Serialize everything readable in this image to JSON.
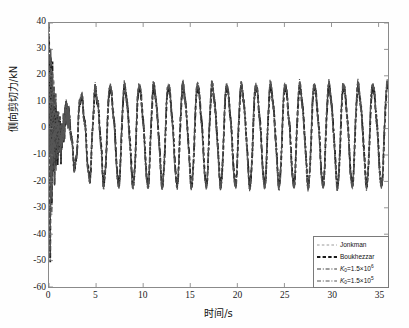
{
  "chart_data": {
    "type": "line",
    "title": "",
    "xlabel": "时间/s",
    "ylabel": "侧向剪切力/kN",
    "xlim": [
      0,
      36
    ],
    "ylim": [
      -60,
      40
    ],
    "xticks": [
      0,
      5,
      10,
      15,
      20,
      25,
      30,
      35
    ],
    "yticks": [
      -60,
      -50,
      -40,
      -30,
      -20,
      -10,
      0,
      10,
      20,
      30,
      40
    ],
    "grid": false,
    "legend_position": "lower right",
    "series": [
      {
        "name": "Jonkman",
        "style": "dashed",
        "color": "#9a9a9a",
        "width": 1.0
      },
      {
        "name": "Boukhezzar",
        "style": "dashed",
        "color": "#1a1a1a",
        "width": 1.8
      },
      {
        "name": "K_0=1.5×10^6",
        "style": "dashdot",
        "color": "#3a3a3a",
        "width": 1.2
      },
      {
        "name": "K_0=1.5×10^5",
        "style": "dashdot",
        "color": "#555555",
        "width": 1.2
      }
    ],
    "transient": {
      "t_start": 0,
      "t_end": 2.0,
      "min": -60,
      "max": 40
    },
    "steady_state": {
      "t_start": 2.0,
      "t_end": 36,
      "period_s": 1.55,
      "peak": 17,
      "trough": -20,
      "mean": -1.5
    }
  },
  "legend": {
    "items": [
      {
        "label": "Jonkman",
        "sym": ""
      },
      {
        "label": "Boukhezzar",
        "sym": ""
      },
      {
        "label": "K",
        "sub": "0",
        "eq": "=1.5×10",
        "sup": "6"
      },
      {
        "label": "K",
        "sub": "0",
        "eq": "=1.5×10",
        "sup": "5"
      }
    ]
  },
  "axes": {
    "xtick_labels": [
      "0",
      "5",
      "10",
      "15",
      "20",
      "25",
      "30",
      "35"
    ],
    "ytick_labels": [
      "40",
      "30",
      "20",
      "10",
      "0",
      "-10",
      "-20",
      "-30",
      "-40",
      "-50",
      "-60"
    ]
  },
  "colors": {
    "frame": "#8a8a8a",
    "jonkman": "#9a9a9a",
    "boukhezzar": "#1a1a1a",
    "k0_6": "#3a3a3a",
    "k0_5": "#555555",
    "background": "#ffffff"
  }
}
